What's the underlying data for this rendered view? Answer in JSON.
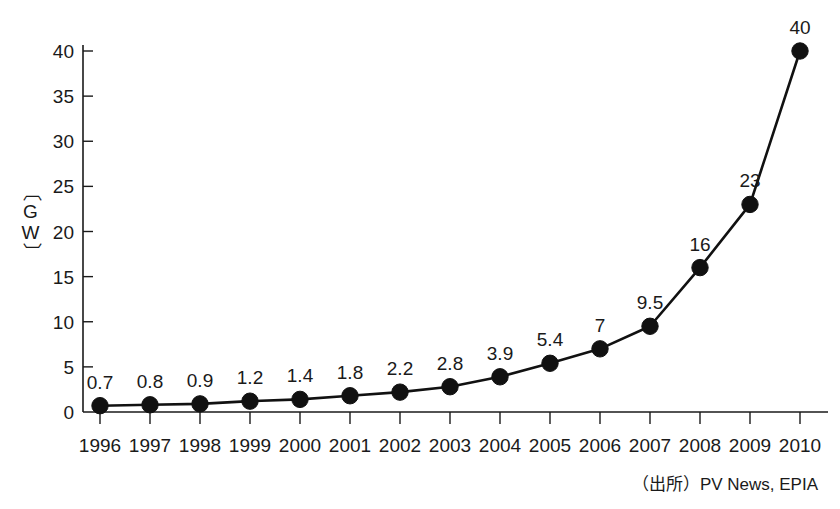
{
  "chart_data": {
    "type": "line",
    "title": "",
    "xlabel": "",
    "ylabel": "〔GW〕",
    "categories": [
      "1996",
      "1997",
      "1998",
      "1999",
      "2000",
      "2001",
      "2002",
      "2003",
      "2004",
      "2005",
      "2006",
      "2007",
      "2008",
      "2009",
      "2010"
    ],
    "values": [
      0.7,
      0.8,
      0.9,
      1.2,
      1.4,
      1.8,
      2.2,
      2.8,
      3.9,
      5.4,
      7,
      9.5,
      16,
      23,
      40
    ],
    "point_labels": [
      "0.7",
      "0.8",
      "0.9",
      "1.2",
      "1.4",
      "1.8",
      "2.2",
      "2.8",
      "3.9",
      "5.4",
      "7",
      "9.5",
      "16",
      "23",
      "40"
    ],
    "ylim": [
      0,
      40
    ],
    "yticks": [
      0,
      5,
      10,
      15,
      20,
      25,
      30,
      35,
      40
    ],
    "ytick_labels": [
      "0",
      "5",
      "10",
      "15",
      "20",
      "25",
      "30",
      "35",
      "40"
    ],
    "grid": false,
    "legend": null,
    "legend_position": "none",
    "marker": "filled-circle",
    "series_color": "#111111",
    "background_color": "#ffffff",
    "annotations": [
      "（出所）PV News, EPIA"
    ]
  },
  "axis": {
    "y_label_text": "〔GW〕"
  },
  "footer": {
    "source_note": "（出所）PV News, EPIA"
  }
}
